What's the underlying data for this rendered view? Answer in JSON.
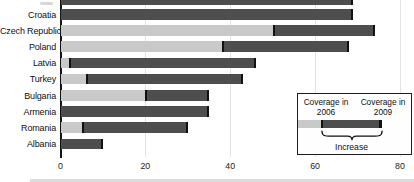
{
  "chart_data": {
    "type": "bar",
    "orientation": "horizontal",
    "title": "",
    "xlabel": "",
    "ylabel": "",
    "categories": [
      "Croatia",
      "Czech Republic",
      "Poland",
      "Latvia",
      "Turkey",
      "Bulgaria",
      "Armenia",
      "Romania",
      "Albania"
    ],
    "series": [
      {
        "name": "Coverage in 2006",
        "values": [
          0,
          50,
          38,
          2,
          6,
          20,
          0,
          5,
          0
        ]
      },
      {
        "name": "Coverage in 2009",
        "values": [
          69,
          74,
          68,
          46,
          43,
          35,
          35,
          30,
          10
        ]
      }
    ],
    "xticks": [
      0,
      20,
      40,
      60,
      80
    ],
    "xtick_labels": [
      "0",
      "20",
      "40",
      "60",
      "80"
    ],
    "xlim": [
      0,
      83
    ],
    "grid": "vertical-light",
    "legend_position": "inside-bottom-right",
    "cropped_partial_bar_top_value": 69,
    "colors": {
      "coverage_2006_fill": "#c9c9c9",
      "coverage_2009_fill": "#4e4e4e",
      "bar_cap": "#111111",
      "gridline": "#e3e3e3",
      "axis": "#151515"
    }
  },
  "legend": {
    "coverage_in": "Coverage in",
    "year_2006": "2006",
    "year_2009": "2009",
    "increase_label": "Increase"
  }
}
